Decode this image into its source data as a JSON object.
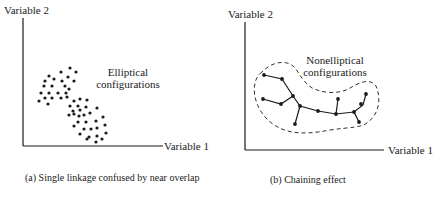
{
  "panels": [
    {
      "id": "a",
      "y_axis_label": "Variable 2",
      "x_axis_label": "Variable 1",
      "annotation_line1": "Elliptical",
      "annotation_line2": "configurations",
      "caption": "(a) Single linkage confused by near overlap"
    },
    {
      "id": "b",
      "y_axis_label": "Variable 2",
      "x_axis_label": "Variable 1",
      "annotation_line1": "Nonelliptical",
      "annotation_line2": "configurations",
      "caption": "(b)   Chaining effect"
    }
  ],
  "colors": {
    "ink": "#1a1a1a",
    "background": "#ffffff"
  }
}
